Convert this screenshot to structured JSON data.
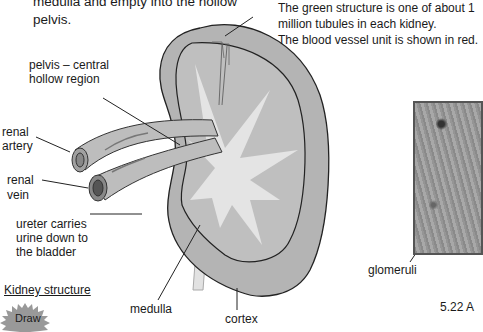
{
  "intro_text": {
    "line1": "medulla and empty into the hollow",
    "line2": "pelvis."
  },
  "note": {
    "line1": "The green structure is one of about 1",
    "line2": "million tubules in each kidney.",
    "line3": "The blood vessel unit is shown in red."
  },
  "labels": {
    "pelvis_line1": "pelvis – central",
    "pelvis_line2": "hollow region",
    "artery_line1": "renal",
    "artery_line2": "artery",
    "vein_line1": "renal",
    "vein_line2": "vein",
    "ureter_line1": "ureter carries",
    "ureter_line2": "urine down to",
    "ureter_line3": "the bladder",
    "medulla": "medulla",
    "cortex": "cortex",
    "glomeruli": "glomeruli"
  },
  "section_title": "Kidney structure",
  "draw_button": "Draw",
  "figure_caption": "5.22 A",
  "colors": {
    "cortex": "#b4b4b4",
    "medulla": "#c4c4c4",
    "pelvis": "#e6e6e6",
    "outline": "#222222"
  }
}
